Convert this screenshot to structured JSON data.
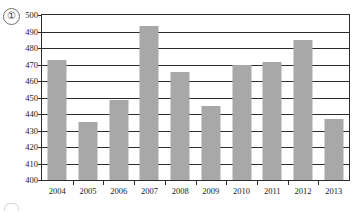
{
  "marker": {
    "label": "①",
    "name": "circled-one"
  },
  "chart_data": {
    "type": "bar",
    "title": "",
    "subtitle": "",
    "xlabel": "",
    "ylabel": "",
    "categories": [
      "2004",
      "2005",
      "2006",
      "2007",
      "2008",
      "2009",
      "2010",
      "2011",
      "2012",
      "2013"
    ],
    "values": [
      472.5,
      435,
      448.5,
      493.5,
      465.5,
      445,
      470,
      471.5,
      485,
      437
    ],
    "series": [
      {
        "name": "",
        "values": [
          472.5,
          435,
          448.5,
          493.5,
          465.5,
          445,
          470,
          471.5,
          485,
          437
        ]
      }
    ],
    "ylim": [
      400,
      500
    ],
    "ytick_values": [
      400,
      410,
      420,
      430,
      440,
      450,
      460,
      470,
      480,
      490,
      500
    ],
    "ytick_labels": [
      "400",
      "410",
      "420",
      "430",
      "440",
      "450",
      "460",
      "470",
      "480",
      "490",
      "500"
    ],
    "xtick_labels": [
      "2004",
      "2005",
      "2006",
      "2007",
      "2008",
      "2009",
      "2010",
      "2011",
      "2012",
      "2013"
    ],
    "grid": true,
    "grid_axis": "y",
    "legend": false,
    "legend_position": "none",
    "bar_color": "#a8a8a8",
    "axis_color": "#2b2b2b",
    "annotations": []
  }
}
